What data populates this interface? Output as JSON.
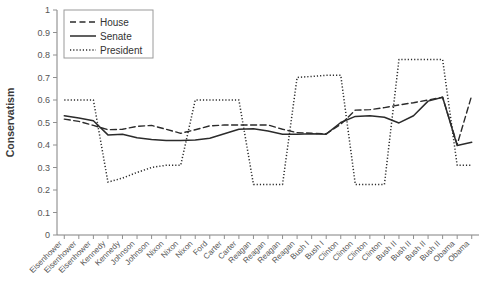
{
  "chart_data": {
    "type": "line",
    "title": "",
    "xlabel": "",
    "ylabel": "Conservatism",
    "ylim": [
      0,
      1
    ],
    "ytick_labels": [
      "0",
      "0.1",
      "0.2",
      "0.3",
      "0.4",
      "0.5",
      "0.6",
      "0.7",
      "0.8",
      "0.9",
      "1"
    ],
    "ytick_values": [
      0,
      0.1,
      0.2,
      0.3,
      0.4,
      0.5,
      0.6,
      0.7,
      0.8,
      0.9,
      1
    ],
    "grid": false,
    "legend_position": "top-left",
    "categories": [
      "Eisenhower",
      "Eisenhower",
      "Eisenhower",
      "Kennedy",
      "Kennedy",
      "Johnson",
      "Johnson",
      "Nixon",
      "Nixon",
      "Nixon",
      "Ford",
      "Carter",
      "Carter",
      "Reagan",
      "Reagan",
      "Reagan",
      "Reagan",
      "Bush I",
      "Bush I",
      "Clinton",
      "Clinton",
      "Clinton",
      "Clinton",
      "Bush II",
      "Bush II",
      "Bush II",
      "Bush II",
      "Obama",
      "Obama"
    ],
    "series": [
      {
        "name": "House",
        "style": "dashed",
        "values": [
          0.515,
          0.505,
          0.487,
          0.468,
          0.47,
          0.483,
          0.487,
          0.47,
          0.452,
          0.468,
          0.485,
          0.489,
          0.489,
          0.489,
          0.489,
          0.47,
          0.455,
          0.452,
          0.45,
          0.492,
          0.555,
          0.557,
          0.566,
          0.578,
          0.588,
          0.6,
          0.612,
          0.402,
          0.62
        ]
      },
      {
        "name": "Senate",
        "style": "solid",
        "values": [
          0.53,
          0.52,
          0.508,
          0.445,
          0.448,
          0.432,
          0.425,
          0.42,
          0.42,
          0.422,
          0.43,
          0.45,
          0.47,
          0.472,
          0.462,
          0.448,
          0.448,
          0.45,
          0.448,
          0.5,
          0.527,
          0.53,
          0.523,
          0.498,
          0.53,
          0.595,
          0.612,
          0.398,
          0.412
        ]
      },
      {
        "name": "President",
        "style": "dotted",
        "values": [
          0.6,
          0.6,
          0.6,
          0.235,
          0.253,
          0.278,
          0.3,
          0.31,
          0.31,
          0.6,
          0.6,
          0.6,
          0.6,
          0.225,
          0.225,
          0.225,
          0.7,
          0.705,
          0.71,
          0.71,
          0.225,
          0.225,
          0.225,
          0.78,
          0.78,
          0.78,
          0.78,
          0.31,
          0.31
        ]
      }
    ],
    "legend": [
      {
        "label": "House",
        "style": "dashed"
      },
      {
        "label": "Senate",
        "style": "solid"
      },
      {
        "label": "President",
        "style": "dotted"
      }
    ]
  }
}
